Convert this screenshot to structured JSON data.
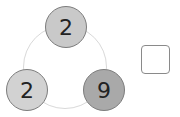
{
  "diagram": {
    "nodes": [
      {
        "position": "top",
        "value": "2",
        "color": "#c9c9c9"
      },
      {
        "position": "bottom-left",
        "value": "2",
        "color": "#d2d2d2"
      },
      {
        "position": "bottom-right",
        "value": "9",
        "color": "#a9a9a9"
      }
    ],
    "answer_box": {
      "value": ""
    }
  }
}
